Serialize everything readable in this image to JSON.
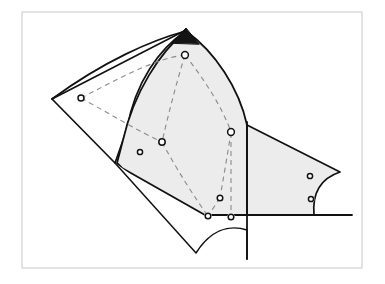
{
  "figure": {
    "type": "line-diagram",
    "canvas": {
      "width": 385,
      "height": 284
    },
    "background_color": "#ffffff",
    "frame": {
      "name": "outer-frame",
      "x": 22,
      "y": 12,
      "width": 340,
      "height": 256,
      "stroke": "#d8d8d8",
      "stroke_width": 1.4,
      "fill": "none"
    },
    "colors": {
      "outline": "#111111",
      "shaded_fill": "#ececec",
      "white_fill": "#ffffff",
      "dark_fill": "#141414",
      "dashed_stroke": "#8a8a8a",
      "frame": "#d8d8d8",
      "marker_stroke": "#111111",
      "marker_fill": "#ffffff"
    },
    "shapes": [
      {
        "name": "left-white-region",
        "fill": "#ffffff",
        "stroke": "#111111",
        "stroke_width": 1.6,
        "description": "Unshaded quadrilateral on the left with a curved upper edge rising to the apex",
        "path": "M 52,99 L 186,31 C 150,44 106,65 52,99 Z"
      },
      {
        "name": "left-white-region-full",
        "fill": "#ffffff",
        "stroke": "#111111",
        "stroke_width": 1.7,
        "description": "Large left polygon, curved top edge from left vertex to apex, straight lower edge sloping down-right",
        "path": "M 52,99 C 104,61 152,40 186,31 L 186,31 C 160,48 135,82 127,129 L 115,163 L 52,99 Z"
      },
      {
        "name": "center-shaded-region",
        "fill": "#ececec",
        "stroke": "#111111",
        "stroke_width": 1.8,
        "description": "Central light-gray lens-shaped region, curved left edge and curved right edge meeting at the top apex",
        "path": "M 186,31 C 160,52 134,92 123,140 L 117,163 L 122,168 L 205,215 L 247,215 L 247,125 C 239,88 215,52 186,31 Z"
      },
      {
        "name": "right-shaded-region",
        "fill": "#ececec",
        "stroke": "#111111",
        "stroke_width": 1.7,
        "description": "Right light-gray polygon with concave curved right edge and two small circular markers",
        "path": "M 247,125 L 340,172 C 322,178 312,192 314,215 L 247,215 Z"
      },
      {
        "name": "bottom-white-notch",
        "fill": "#ffffff",
        "stroke": "#111111",
        "stroke_width": 1.5,
        "description": "Lower white wedge below the shaded regions with a concave scalloped upper-right boundary",
        "path": "M 115,163 L 196,253 C 210,231 228,224 247,230 L 247,259"
      },
      {
        "name": "apex-dark-triangle",
        "fill": "#141414",
        "stroke": "#111111",
        "stroke_width": 1.0,
        "description": "Small solid black triangle at the top apex where the regions meet",
        "path": "M 172,43 L 186,28 L 199,44 Z"
      }
    ],
    "markers": [
      {
        "name": "node-left",
        "cx": 81,
        "cy": 98,
        "r": 3.0,
        "label": ""
      },
      {
        "name": "node-apex",
        "cx": 185,
        "cy": 55,
        "r": 3.4,
        "label": ""
      },
      {
        "name": "node-center",
        "cx": 162,
        "cy": 142,
        "r": 3.2,
        "label": ""
      },
      {
        "name": "node-right-mid",
        "cx": 231,
        "cy": 132,
        "r": 3.4,
        "label": ""
      },
      {
        "name": "node-edge-left",
        "cx": 140,
        "cy": 152,
        "r": 2.6,
        "label": ""
      },
      {
        "name": "node-lower-mid",
        "cx": 220,
        "cy": 198,
        "r": 2.8,
        "label": ""
      },
      {
        "name": "node-bottom-left",
        "cx": 208,
        "cy": 216,
        "r": 2.8,
        "label": ""
      },
      {
        "name": "node-bottom-right",
        "cx": 231,
        "cy": 217,
        "r": 2.8,
        "label": ""
      },
      {
        "name": "node-right-upper",
        "cx": 310,
        "cy": 176,
        "r": 2.6,
        "label": ""
      },
      {
        "name": "node-right-lower",
        "cx": 311,
        "cy": 199,
        "r": 2.6,
        "label": ""
      }
    ],
    "dashed_links": [
      {
        "name": "link-apex-to-left",
        "path": "M 185,55 C 155,58 112,82 81,98",
        "dash": "5,4"
      },
      {
        "name": "link-left-to-center",
        "path": "M 81,98 C 110,114 140,132 162,142",
        "dash": "5,4"
      },
      {
        "name": "link-apex-to-center",
        "path": "M 185,55 C 176,84 168,116 162,142",
        "dash": "5,4"
      },
      {
        "name": "link-apex-to-rightmid",
        "path": "M 185,55 C 205,80 223,109 231,132",
        "dash": "5,4"
      },
      {
        "name": "link-center-to-bottomleft",
        "path": "M 162,142 C 177,170 195,198 208,216",
        "dash": "5,4"
      },
      {
        "name": "link-rightmid-to-lowermid",
        "path": "M 231,132 C 228,152 223,180 220,198",
        "dash": "5,4"
      },
      {
        "name": "link-lowermid-to-bottomleft",
        "path": "M 220,198 L 208,216",
        "dash": "5,4"
      },
      {
        "name": "link-rightmid-vertical",
        "path": "M 231,133 L 231,217",
        "dash": "5,4"
      }
    ],
    "solid_leaders": [
      {
        "name": "leader-apex-left-ridge",
        "path": "M 52,99 L 186,30",
        "stroke_width": 1.6
      },
      {
        "name": "leader-vertical-right",
        "path": "M 247,122 L 247,259",
        "stroke_width": 1.8
      },
      {
        "name": "leader-baseline-right",
        "path": "M 205,215 L 352,215",
        "stroke_width": 1.8
      }
    ]
  }
}
